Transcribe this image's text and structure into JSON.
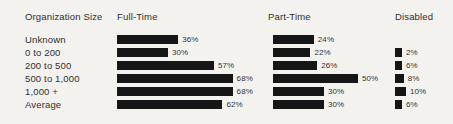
{
  "chart_data": {
    "type": "bar",
    "orientation": "horizontal",
    "title": "",
    "xlabel": "",
    "ylabel": "Organization Size",
    "xlim": [
      0,
      100
    ],
    "grid": false,
    "legend_position": "top-as-column-headers",
    "value_suffix": "%",
    "category_header": "Organization Size",
    "categories": [
      "Unknown",
      "0 to 200",
      "200 to 500",
      "500 to 1,000",
      "1,000 +",
      "Average"
    ],
    "series": [
      {
        "name": "Full-Time",
        "values": [
          36,
          30,
          57,
          68,
          68,
          62
        ]
      },
      {
        "name": "Part-Time",
        "values": [
          24,
          22,
          26,
          50,
          30,
          30
        ]
      },
      {
        "name": "Disabled",
        "values": [
          null,
          2,
          6,
          8,
          10,
          6
        ]
      }
    ],
    "labels": {
      "Full-Time": [
        "36%",
        "30%",
        "57%",
        "68%",
        "68%",
        "62%"
      ],
      "Part-Time": [
        "24%",
        "22%",
        "26%",
        "50%",
        "30%",
        "30%"
      ],
      "Disabled": [
        "",
        "2%",
        "6%",
        "8%",
        "10%",
        "6%"
      ]
    }
  },
  "header": {
    "category": "Organization Size",
    "fulltime": "Full-Time",
    "parttime": "Part-Time",
    "disabled": "Disabled"
  },
  "rows": [
    {
      "label": "Unknown",
      "fulltime": {
        "value": 36,
        "text": "36%"
      },
      "parttime": {
        "value": 24,
        "text": "24%"
      },
      "disabled": {
        "value": null,
        "text": ""
      }
    },
    {
      "label": "0 to 200",
      "fulltime": {
        "value": 30,
        "text": "30%"
      },
      "parttime": {
        "value": 22,
        "text": "22%"
      },
      "disabled": {
        "value": 2,
        "text": "2%"
      }
    },
    {
      "label": "200 to 500",
      "fulltime": {
        "value": 57,
        "text": "57%"
      },
      "parttime": {
        "value": 26,
        "text": "26%"
      },
      "disabled": {
        "value": 6,
        "text": "6%"
      }
    },
    {
      "label": "500 to 1,000",
      "fulltime": {
        "value": 68,
        "text": "68%"
      },
      "parttime": {
        "value": 50,
        "text": "50%"
      },
      "disabled": {
        "value": 8,
        "text": "8%"
      }
    },
    {
      "label": "1,000 +",
      "fulltime": {
        "value": 68,
        "text": "68%"
      },
      "parttime": {
        "value": 30,
        "text": "30%"
      },
      "disabled": {
        "value": 10,
        "text": "10%"
      }
    },
    {
      "label": "Average",
      "fulltime": {
        "value": 62,
        "text": "62%"
      },
      "parttime": {
        "value": 30,
        "text": "30%"
      },
      "disabled": {
        "value": 6,
        "text": "6%"
      }
    }
  ],
  "style": {
    "bar_color": "#161616",
    "background": "#f4f2ee",
    "text_color": "#2e2e2e",
    "px_per_percent": 1.7,
    "disabled_px_per_percent": 1.1,
    "disabled_min_px": 7
  }
}
